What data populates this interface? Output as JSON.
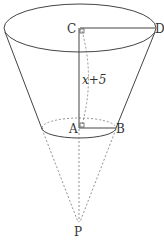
{
  "diagram": {
    "type": "frustum-of-cone",
    "labels": {
      "C": "C",
      "D": "D",
      "A": "A",
      "B": "B",
      "P": "P",
      "height": "x+5"
    },
    "colors": {
      "line": "#444444",
      "dashed": "#777777",
      "text": "#333333"
    }
  }
}
